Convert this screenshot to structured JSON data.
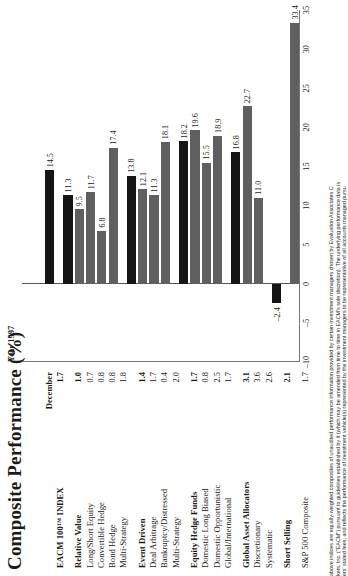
{
  "title": "Composite Performance (%)",
  "columns": {
    "december": "December",
    "year": "Year 1997"
  },
  "footnote": [
    "above indices are equally-weighted composites of unaudited performance information provided by certain investment managers chosen by Evaluation Associates C",
    "kets, Inc. (\"EACM\") pursuant to guidelines established by it (which may be amended from time to time in EACM's sole discretion). The underlying performance data is",
    "ers' stated fees, and reflects the performance of investment vehicle(s) represented by the investment managers to be representative of all accounts managed pursu"
  ],
  "chart_data": {
    "type": "bar",
    "title": "Composite Performance (%)",
    "xlabel": "",
    "ylabel": "",
    "xlim": [
      -10,
      35
    ],
    "grid": false,
    "legend": "none",
    "orientation": "horizontal",
    "ticks": [
      -10,
      -5,
      0,
      5,
      10,
      15,
      20,
      25,
      30,
      35
    ],
    "series_names": [
      "December",
      "Year 1997"
    ],
    "categories": [
      "EACM 100™ INDEX",
      "Relative Value",
      "Long/Short Equity",
      "Convertible Hedge",
      "Bond Hedge",
      "Multi-Strategy",
      "Event Driven",
      "Deal Arbitrage",
      "Bankruptcy/Distressed",
      "Multi-Strategy",
      "Equity Hedge Funds",
      "Domestic Long Biased",
      "Domestic Opportunistic",
      "Global/International",
      "Global Asset Allocators",
      "Discretionary",
      "Systematic",
      "Short Selling",
      "S&P 500 Composite"
    ],
    "december": [
      1.7,
      1.0,
      0.7,
      0.8,
      0.8,
      1.8,
      1.4,
      1.7,
      0.4,
      2.0,
      1.7,
      0.8,
      2.5,
      1.7,
      3.1,
      3.6,
      2.6,
      2.1,
      1.7
    ],
    "values": [
      14.5,
      11.3,
      9.5,
      11.7,
      6.8,
      17.4,
      13.8,
      12.1,
      11.3,
      18.1,
      18.2,
      19.6,
      15.5,
      18.9,
      16.8,
      22.7,
      11.0,
      -2.4,
      33.4
    ]
  },
  "rows": [
    {
      "label": "EACM 100™ INDEX",
      "december": "1.7",
      "value": 14.5,
      "value_label": "14.5",
      "group": true,
      "gap_before": 0
    },
    {
      "label": "Relative Value",
      "december": "1.0",
      "value": 11.3,
      "value_label": "11.3",
      "group": true,
      "gap_before": 1
    },
    {
      "label": "Long/Short Equity",
      "december": "0.7",
      "value": 9.5,
      "value_label": "9.5",
      "group": false,
      "gap_before": 0
    },
    {
      "label": "Convertible Hedge",
      "december": "0.8",
      "value": 11.7,
      "value_label": "11.7",
      "group": false,
      "gap_before": 0
    },
    {
      "label": "Bond Hedge",
      "december": "0.8",
      "value": 6.8,
      "value_label": "6.8",
      "group": false,
      "gap_before": 0
    },
    {
      "label": "Multi-Strategy",
      "december": "1.8",
      "value": 17.4,
      "value_label": "17.4",
      "group": false,
      "gap_before": 0
    },
    {
      "label": "Event Driven",
      "december": "1.4",
      "value": 13.8,
      "value_label": "13.8",
      "group": true,
      "gap_before": 1
    },
    {
      "label": "Deal Arbitrage",
      "december": "1.7",
      "value": 12.1,
      "value_label": "12.1",
      "group": false,
      "gap_before": 0
    },
    {
      "label": "Bankruptcy/Distressed",
      "december": "0.4",
      "value": 11.3,
      "value_label": "11.3",
      "group": false,
      "gap_before": 0
    },
    {
      "label": "Multi-Strategy",
      "december": "2.0",
      "value": 18.1,
      "value_label": "18.1",
      "group": false,
      "gap_before": 0
    },
    {
      "label": "Equity Hedge Funds",
      "december": "1.7",
      "value": 18.2,
      "value_label": "18.2",
      "group": true,
      "gap_before": 1
    },
    {
      "label": "Domestic Long Biased",
      "december": "0.8",
      "value": 19.6,
      "value_label": "19.6",
      "group": false,
      "gap_before": 0
    },
    {
      "label": "Domestic Opportunistic",
      "december": "2.5",
      "value": 15.5,
      "value_label": "15.5",
      "group": false,
      "gap_before": 0
    },
    {
      "label": "Global/International",
      "december": "1.7",
      "value": 18.9,
      "value_label": "18.9",
      "group": false,
      "gap_before": 0
    },
    {
      "label": "Global Asset Allocators",
      "december": "3.1",
      "value": 16.8,
      "value_label": "16.8",
      "group": true,
      "gap_before": 1
    },
    {
      "label": "Discretionary",
      "december": "3.6",
      "value": 22.7,
      "value_label": "22.7",
      "group": false,
      "gap_before": 0
    },
    {
      "label": "Systematic",
      "december": "2.6",
      "value": 11.0,
      "value_label": "11.0",
      "group": false,
      "gap_before": 0
    },
    {
      "label": "Short Selling",
      "december": "2.1",
      "value": -2.4,
      "value_label": "–2.4",
      "group": true,
      "gap_before": 1
    },
    {
      "label": "S&P 500 Composite",
      "december": "1.7",
      "value": 33.4,
      "value_label": "33.4",
      "group": false,
      "gap_before": 1
    }
  ]
}
